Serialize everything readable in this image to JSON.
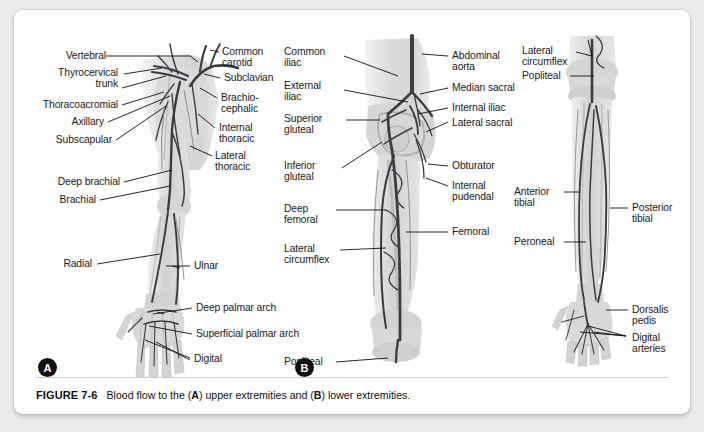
{
  "figure": {
    "number": "FIGURE 7-6",
    "caption_part1": "Blood flow to the (",
    "caption_a": "A",
    "caption_part2": ") upper extremities and (",
    "caption_b": "B",
    "caption_part3": ") lower extremities."
  },
  "colors": {
    "page_background": "#eceaea",
    "card_background": "#ffffff",
    "label_text": "#1a1a1a",
    "marker_fill": "#111111",
    "marker_text": "#ffffff",
    "vessel_dark": "#3a3a42",
    "vessel_mid": "#6b6b73",
    "limb_fill": "#d9d9d9",
    "bone_fill": "#c4c4c4",
    "rule": "#c9c9c9"
  },
  "panels": [
    {
      "id": "A",
      "marker": "A",
      "name": "upper-extremity",
      "labels_left": [
        "Vertebral",
        "Thyrocervical\ntrunk",
        "Thoracoacromial",
        "Axillary",
        "Subscapular",
        "Deep brachial",
        "Brachial",
        "Radial"
      ],
      "labels_right": [
        "Common\ncarotid",
        "Subclavian",
        "Brachio-\ncephalic",
        "Internal\nthoracic",
        "Lateral\nthoracic",
        "Ulnar",
        "Deep palmar arch",
        "Superficial palmar arch",
        "Digital"
      ]
    },
    {
      "id": "B",
      "marker": "B",
      "name": "lower-extremity",
      "labels_left": [
        "Common\niliac",
        "External\niliac",
        "Superior\ngluteal",
        "Inferior\ngluteal",
        "Deep\nfemoral",
        "Lateral\ncircumflex",
        "Popliteal"
      ],
      "labels_right": [
        "Abdominal\naorta",
        "Median sacral",
        "Internal iliac",
        "Lateral sacral",
        "Obturator",
        "Internal\npudendal",
        "Femoral"
      ]
    },
    {
      "id": "C",
      "marker": "",
      "name": "lower-leg-posterior",
      "labels_left": [
        "Lateral\ncircumflex",
        "Popliteal",
        "Anterior\ntibial",
        "Peroneal"
      ],
      "labels_right": [
        "Posterior\ntibial",
        "Dorsalis\npedis",
        "Digital\narteries"
      ]
    }
  ],
  "label_positions": {
    "a_vertebral": "Vertebral",
    "a_thyrocervical": "Thyrocervical",
    "a_thyrocervical2": "trunk",
    "a_thoracoacromial": "Thoracoacromial",
    "a_axillary": "Axillary",
    "a_subscapular": "Subscapular",
    "a_deep_brachial": "Deep brachial",
    "a_brachial": "Brachial",
    "a_radial": "Radial",
    "a_common_carotid1": "Common",
    "a_common_carotid2": "carotid",
    "a_subclavian": "Subclavian",
    "a_brachiocephalic1": "Brachio-",
    "a_brachiocephalic2": "cephalic",
    "a_internal_thoracic1": "Internal",
    "a_internal_thoracic2": "thoracic",
    "a_lateral_thoracic1": "Lateral",
    "a_lateral_thoracic2": "thoracic",
    "a_ulnar": "Ulnar",
    "a_deep_palmar": "Deep palmar arch",
    "a_superficial_palmar": "Superficial palmar arch",
    "a_digital": "Digital",
    "b_common_iliac1": "Common",
    "b_common_iliac2": "iliac",
    "b_external_iliac1": "External",
    "b_external_iliac2": "iliac",
    "b_superior_gluteal1": "Superior",
    "b_superior_gluteal2": "gluteal",
    "b_inferior_gluteal1": "Inferior",
    "b_inferior_gluteal2": "gluteal",
    "b_deep_femoral1": "Deep",
    "b_deep_femoral2": "femoral",
    "b_lateral_circumflex1": "Lateral",
    "b_lateral_circumflex2": "circumflex",
    "b_popliteal": "Popliteal",
    "b_abdominal_aorta1": "Abdominal",
    "b_abdominal_aorta2": "aorta",
    "b_median_sacral": "Median sacral",
    "b_internal_iliac": "Internal iliac",
    "b_lateral_sacral": "Lateral sacral",
    "b_obturator": "Obturator",
    "b_internal_pudendal1": "Internal",
    "b_internal_pudendal2": "pudendal",
    "b_femoral": "Femoral",
    "c_lateral_circumflex1": "Lateral",
    "c_lateral_circumflex2": "circumflex",
    "c_popliteal": "Popliteal",
    "c_anterior_tibial1": "Anterior",
    "c_anterior_tibial2": "tibial",
    "c_peroneal": "Peroneal",
    "c_posterior_tibial1": "Posterior",
    "c_posterior_tibial2": "tibial",
    "c_dorsalis_pedis1": "Dorsalis",
    "c_dorsalis_pedis2": "pedis",
    "c_digital_arteries1": "Digital",
    "c_digital_arteries2": "arteries"
  }
}
